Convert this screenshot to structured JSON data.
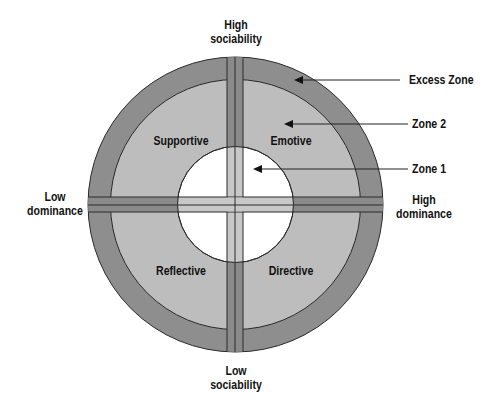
{
  "diagram": {
    "type": "social-style-circle",
    "colors": {
      "excess_zone": "#8e8e8e",
      "zone2": "#bdbdbd",
      "zone1": "#ffffff",
      "outer_bar": "#8a8a8a",
      "inner_bar": "#c8c8c8",
      "stroke": "#2a2a2a",
      "text": "#111111"
    },
    "axes": {
      "top": {
        "line1": "High",
        "line2": "sociability"
      },
      "bottom": {
        "line1": "Low",
        "line2": "sociability"
      },
      "left": {
        "line1": "Low",
        "line2": "dominance"
      },
      "right": {
        "line1": "High",
        "line2": "dominance"
      }
    },
    "quadrants": [
      {
        "position": "top-left",
        "label": "Supportive"
      },
      {
        "position": "top-right",
        "label": "Emotive"
      },
      {
        "position": "bottom-left",
        "label": "Reflective"
      },
      {
        "position": "bottom-right",
        "label": "Directive"
      }
    ],
    "zones": [
      {
        "label": "Excess Zone"
      },
      {
        "label": "Zone 2"
      },
      {
        "label": "Zone 1"
      }
    ]
  }
}
